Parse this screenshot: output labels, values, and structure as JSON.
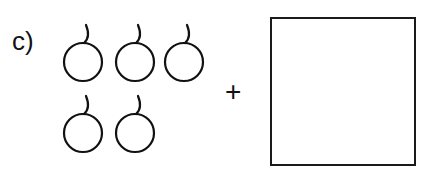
{
  "exercise": {
    "label": "c)",
    "operator": "+",
    "fruit_count": 5,
    "fruit_icon": "cherry-icon",
    "rows": [
      3,
      2
    ],
    "answer_box": {
      "value": ""
    }
  }
}
